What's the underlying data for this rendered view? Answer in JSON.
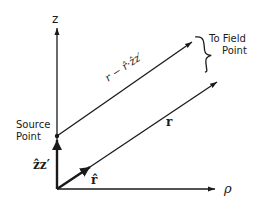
{
  "diagram": {
    "axes": {
      "vertical_label": "z",
      "horizontal_label": "ρ"
    },
    "labels": {
      "source_point_line1": "Source",
      "source_point_line2": "Point",
      "field_point_line1": "To Field",
      "field_point_line2": "Point",
      "displacement_vector": "r − r̂·ẑz′",
      "position_vector": "r",
      "unit_vector": "r̂",
      "source_offset": "ẑz′"
    },
    "colors": {
      "stroke": "#1a1a1a",
      "background": "#ffffff"
    }
  }
}
